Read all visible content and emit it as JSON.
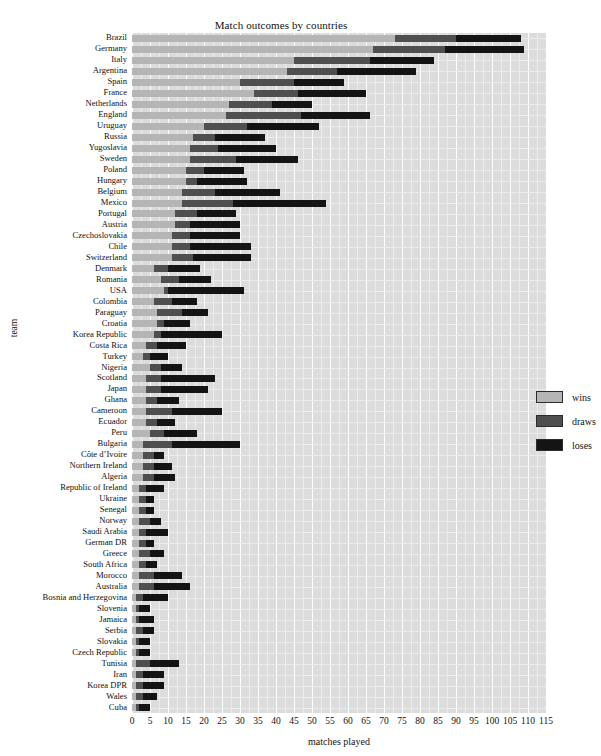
{
  "chart_data": {
    "type": "bar",
    "orientation": "horizontal",
    "stacked": true,
    "title": "Match outcomes by countries",
    "xlabel": "matches played",
    "ylabel": "team",
    "xlim": [
      0,
      115
    ],
    "xticks": [
      0,
      5,
      10,
      15,
      20,
      25,
      30,
      35,
      40,
      45,
      50,
      55,
      60,
      65,
      70,
      75,
      80,
      85,
      90,
      95,
      100,
      105,
      110,
      115
    ],
    "grid": true,
    "legend_position": "right-inside",
    "legend": [
      {
        "name": "wins",
        "color": "#b5b5b5"
      },
      {
        "name": "draws",
        "color": "#4f4f4f"
      },
      {
        "name": "loses",
        "color": "#141414"
      }
    ],
    "categories": [
      "Brazil",
      "Germany",
      "Italy",
      "Argentina",
      "Spain",
      "France",
      "Netherlands",
      "England",
      "Uruguay",
      "Russia",
      "Yugoslavia",
      "Sweden",
      "Poland",
      "Hungary",
      "Belgium",
      "Mexico",
      "Portugal",
      "Austria",
      "Czechoslovakia",
      "Chile",
      "Switzerland",
      "Denmark",
      "Romania",
      "USA",
      "Colombia",
      "Paraguay",
      "Croatia",
      "Korea Republic",
      "Costa Rica",
      "Turkey",
      "Nigeria",
      "Scotland",
      "Japan",
      "Ghana",
      "Cameroon",
      "Ecuador",
      "Peru",
      "Bulgaria",
      "Côte d’Ivoire",
      "Northern Ireland",
      "Algeria",
      "Republic of Ireland",
      "Ukraine",
      "Senegal",
      "Norway",
      "Saudi Arabia",
      "German DR",
      "Greece",
      "South Africa",
      "Morocco",
      "Australia",
      "Bosnia and Herzegovina",
      "Slovenia",
      "Jamaica",
      "Serbia",
      "Slovakia",
      "Czech Republic",
      "Tunisia",
      "Iran",
      "Korea DPR",
      "Wales",
      "Cuba"
    ],
    "series": [
      {
        "name": "wins",
        "values": [
          73,
          67,
          45,
          43,
          30,
          34,
          27,
          26,
          20,
          17,
          16,
          16,
          15,
          15,
          14,
          14,
          12,
          12,
          11,
          11,
          11,
          6,
          8,
          9,
          6,
          7,
          7,
          6,
          4,
          3,
          5,
          4,
          4,
          4,
          4,
          4,
          5,
          3,
          3,
          3,
          3,
          2,
          2,
          2,
          2,
          2,
          2,
          2,
          2,
          2,
          2,
          1,
          1,
          1,
          1,
          1,
          1,
          1,
          1,
          1,
          1,
          1
        ]
      },
      {
        "name": "draws",
        "values": [
          17,
          20,
          21,
          14,
          15,
          12,
          12,
          21,
          12,
          6,
          8,
          13,
          5,
          3,
          9,
          14,
          6,
          4,
          5,
          5,
          6,
          4,
          5,
          1,
          5,
          7,
          2,
          2,
          3,
          2,
          3,
          4,
          4,
          3,
          7,
          3,
          4,
          8,
          3,
          3,
          3,
          2,
          2,
          2,
          3,
          2,
          2,
          3,
          2,
          4,
          4,
          2,
          1,
          1,
          2,
          1,
          1,
          4,
          2,
          2,
          2,
          1
        ]
      },
      {
        "name": "loses",
        "values": [
          18,
          22,
          18,
          22,
          14,
          19,
          11,
          19,
          20,
          14,
          16,
          17,
          11,
          14,
          18,
          26,
          11,
          14,
          14,
          17,
          16,
          9,
          9,
          21,
          7,
          7,
          7,
          17,
          8,
          5,
          6,
          15,
          13,
          6,
          14,
          5,
          9,
          19,
          3,
          5,
          6,
          5,
          2,
          2,
          3,
          6,
          2,
          4,
          3,
          8,
          10,
          7,
          3,
          4,
          3,
          3,
          3,
          8,
          6,
          6,
          4,
          3
        ]
      }
    ]
  }
}
